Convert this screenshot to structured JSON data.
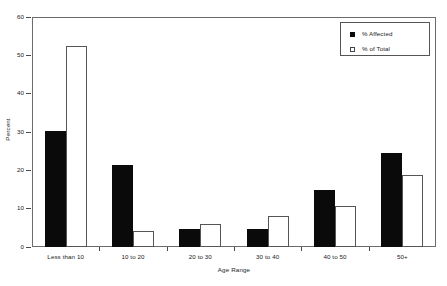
{
  "chart_data": {
    "type": "bar",
    "title": "",
    "xlabel": "Age Range",
    "ylabel": "Percent",
    "categories": [
      "Less than 10",
      "10 to 20",
      "20 to 30",
      "30 to 40",
      "40 to 50",
      "50+"
    ],
    "series": [
      {
        "name": "% Affected",
        "values": [
          30.3,
          21.4,
          4.8,
          4.8,
          14.8,
          24.6
        ],
        "color": "#0a0a0a",
        "style": "filled"
      },
      {
        "name": "% of Total",
        "values": [
          52.5,
          4.3,
          5.9,
          8.2,
          10.7,
          18.8
        ],
        "color": "#ffffff",
        "style": "hollow"
      }
    ],
    "ylim": [
      0,
      60
    ],
    "yticks": [
      0,
      10,
      20,
      30,
      40,
      50,
      60
    ],
    "ytick_labels": [
      "0",
      "10",
      "20",
      "30",
      "40",
      "50",
      "60"
    ],
    "grid": false,
    "legend_position": "top-right",
    "frame": true
  },
  "legend": {
    "entries": [
      {
        "label": "% Affected",
        "swatch": "filled-square"
      },
      {
        "label": "% of Total",
        "swatch": "hollow-square"
      }
    ]
  },
  "axes": {
    "y_title": "Percent",
    "x_title": "Age Range"
  }
}
